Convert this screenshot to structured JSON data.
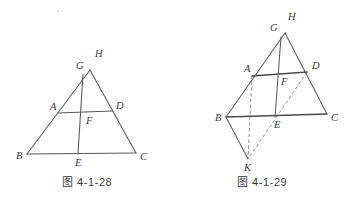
{
  "page": {
    "background_color": "#ffffff",
    "ink_color": "#5a5a5a",
    "label_color": "#3a3a3a",
    "width": 349,
    "height": 209
  },
  "figures": [
    {
      "id": "figure-4-1-28",
      "caption": "图 4-1-28",
      "description": "Triangle BHC with cevian HE, segment AD parallel to BC meeting HE at F, and point G on HB",
      "points": [
        {
          "name": "H",
          "label": "H",
          "x": 90,
          "y": 70,
          "label_x": 95,
          "label_y": 57
        },
        {
          "name": "G",
          "label": "G",
          "x": 83,
          "y": 74,
          "label_x": 76,
          "label_y": 69
        },
        {
          "name": "A",
          "label": "A",
          "x": 58,
          "y": 113,
          "label_x": 50,
          "label_y": 110
        },
        {
          "name": "D",
          "label": "D",
          "x": 112,
          "y": 111,
          "label_x": 116,
          "label_y": 109
        },
        {
          "name": "F",
          "label": "F",
          "x": 89,
          "y": 114,
          "label_x": 86,
          "label_y": 124
        },
        {
          "name": "B",
          "label": "B",
          "x": 27,
          "y": 154,
          "label_x": 16,
          "label_y": 159
        },
        {
          "name": "E",
          "label": "E",
          "x": 78,
          "y": 154,
          "label_x": 75,
          "label_y": 166
        },
        {
          "name": "C",
          "label": "C",
          "x": 136,
          "y": 153,
          "label_x": 140,
          "label_y": 160
        }
      ],
      "solid_segments": [
        {
          "from": "B",
          "to": "C",
          "name": "segment-BC"
        },
        {
          "from": "B",
          "to": "H",
          "name": "segment-BH"
        },
        {
          "from": "H",
          "to": "C",
          "name": "segment-HC"
        },
        {
          "from": "A",
          "to": "D",
          "name": "segment-AD"
        },
        {
          "from": "G",
          "to": "E",
          "name": "segment-GE"
        }
      ],
      "dashed_segments": []
    },
    {
      "id": "figure-4-1-29",
      "caption": "图 4-1-29",
      "description": "Oblique triangle BHC with cevian GE, segment AD meeting GE at F, plus dashed lines AK and DEK to external point K",
      "points": [
        {
          "name": "H",
          "label": "H",
          "x": 285,
          "y": 33,
          "label_x": 288,
          "label_y": 20
        },
        {
          "name": "G",
          "label": "G",
          "x": 281,
          "y": 37,
          "label_x": 270,
          "label_y": 31
        },
        {
          "name": "A",
          "label": "A",
          "x": 252,
          "y": 76,
          "label_x": 244,
          "label_y": 72
        },
        {
          "name": "D",
          "label": "D",
          "x": 307,
          "y": 72,
          "label_x": 312,
          "label_y": 69
        },
        {
          "name": "F",
          "label": "F",
          "x": 282,
          "y": 74,
          "label_x": 281,
          "label_y": 85
        },
        {
          "name": "B",
          "label": "B",
          "x": 226,
          "y": 117,
          "label_x": 215,
          "label_y": 121
        },
        {
          "name": "E",
          "label": "E",
          "x": 275,
          "y": 117,
          "label_x": 274,
          "label_y": 128
        },
        {
          "name": "C",
          "label": "C",
          "x": 327,
          "y": 114,
          "label_x": 331,
          "label_y": 121
        },
        {
          "name": "K",
          "label": "K",
          "x": 248,
          "y": 159,
          "label_x": 244,
          "label_y": 171
        }
      ],
      "solid_segments": [
        {
          "from": "B",
          "to": "C",
          "name": "segment-BC"
        },
        {
          "from": "B",
          "to": "H",
          "name": "segment-BH"
        },
        {
          "from": "H",
          "to": "C",
          "name": "segment-HC"
        },
        {
          "from": "A",
          "to": "D",
          "name": "segment-AD"
        },
        {
          "from": "G",
          "to": "E",
          "name": "segment-GE"
        },
        {
          "from": "B",
          "to": "K",
          "name": "segment-BK"
        }
      ],
      "dashed_segments": [
        {
          "from": "A",
          "to": "K",
          "name": "segment-AK"
        },
        {
          "from": "D",
          "to": "K",
          "name": "segment-DK"
        }
      ]
    }
  ]
}
